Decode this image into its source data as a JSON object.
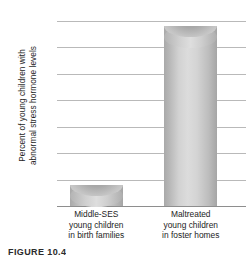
{
  "chart_data": {
    "type": "bar",
    "title": "",
    "xlabel": "",
    "ylabel": "Percent of young children with\nabnormal stress hormone levels",
    "categories": [
      "Middle-SES\nyoung children\nin birth families",
      "Maltreated\nyoung children\nin foster homes"
    ],
    "values": [
      4,
      34
    ],
    "ylim": [
      0,
      35
    ],
    "yticks": [
      0,
      5,
      10,
      15,
      20,
      25,
      30,
      35
    ],
    "ytick_labels": [
      "0",
      "5",
      "10",
      "15",
      "20",
      "25",
      "30",
      "35"
    ],
    "grid": true,
    "legend": "none",
    "bar_color": "#d2d2d2",
    "bar_edge_color": "#a5a5a5",
    "gridline_color": "#b9b9b9"
  },
  "caption": {
    "text": "FIGURE 10.4"
  }
}
